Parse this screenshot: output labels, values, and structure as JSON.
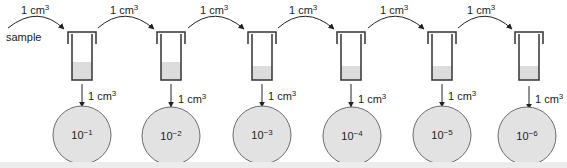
{
  "diagram": {
    "sample_label": "sample",
    "transfer_volume": "1 cm",
    "transfer_unit_exp": "3",
    "colors": {
      "outline": "#333333",
      "liquid": "#dcdcdc",
      "plate_fill": "#e2e2e2",
      "plate_stroke": "#6b6b6b",
      "background": "#ffffff"
    },
    "tubes": [
      {
        "index": 1,
        "x": 68
      },
      {
        "index": 2,
        "x": 158
      },
      {
        "index": 3,
        "x": 248
      },
      {
        "index": 4,
        "x": 338
      },
      {
        "index": 5,
        "x": 428
      },
      {
        "index": 6,
        "x": 514
      }
    ],
    "plates": [
      {
        "base": "10",
        "exp": "−1"
      },
      {
        "base": "10",
        "exp": "−2"
      },
      {
        "base": "10",
        "exp": "−3"
      },
      {
        "base": "10",
        "exp": "−4"
      },
      {
        "base": "10",
        "exp": "−5"
      },
      {
        "base": "10",
        "exp": "−6"
      }
    ],
    "labels": {
      "t1": "1 cm",
      "t2": "1 cm",
      "t3": "1 cm",
      "t4": "1 cm",
      "t5": "1 cm",
      "t6": "1 cm",
      "d1": "1 cm",
      "d2": "1 cm",
      "d3": "1 cm",
      "d4": "1 cm",
      "d5": "1 cm",
      "d6": "1 cm",
      "exp": "3",
      "p1b": "10",
      "p1e": "−1",
      "p2b": "10",
      "p2e": "−2",
      "p3b": "10",
      "p3e": "−3",
      "p4b": "10",
      "p4e": "−4",
      "p5b": "10",
      "p5e": "−5",
      "p6b": "10",
      "p6e": "−6"
    }
  }
}
